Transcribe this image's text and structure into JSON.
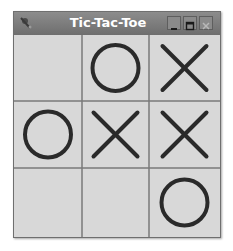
{
  "window": {
    "title": "Tic-Tac-Toe",
    "controls": [
      "minimize",
      "maximize",
      "close"
    ]
  },
  "board": {
    "cells": [
      [
        "",
        "O",
        "X"
      ],
      [
        "O",
        "X",
        "X"
      ],
      [
        "",
        "",
        "O"
      ]
    ]
  },
  "colors": {
    "titlebar": "#7d7d7d",
    "board_bg": "#d8d8d8",
    "grid_line": "#7a7a7a",
    "mark": "#2a2a2a"
  }
}
